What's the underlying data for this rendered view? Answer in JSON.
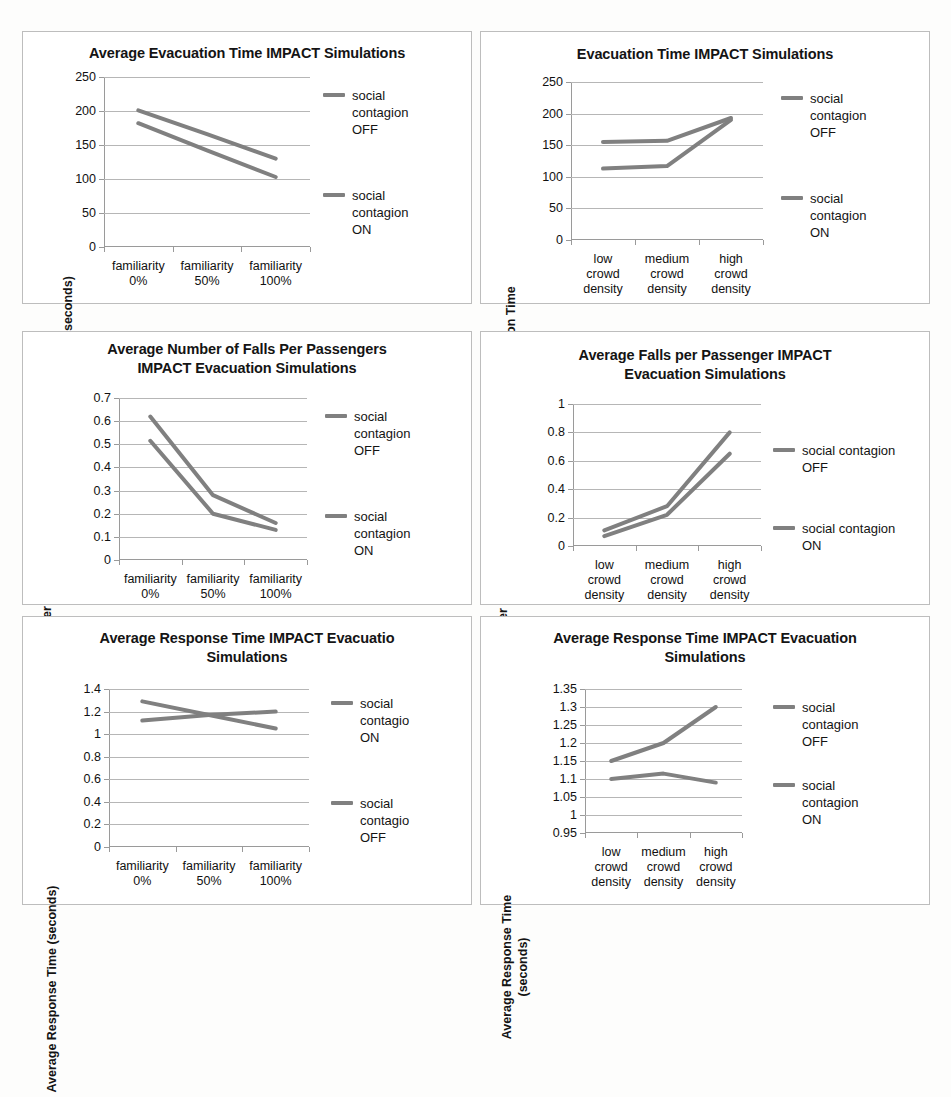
{
  "figure": {
    "panel_count": 6,
    "line_color": "#808080",
    "grid_color": "#b6b6b6",
    "axis_color": "#9a9a9a"
  },
  "chart_data": [
    {
      "id": "chart1",
      "type": "line",
      "title": "Average Evacuation Time IMPACT Simulations",
      "ylabel": "Evacuation Time (seconds)",
      "xlabel": "",
      "categories": [
        "familiarity\n0%",
        "familiarity\n50%",
        "familiarity\n100%"
      ],
      "yticks": [
        0,
        50,
        100,
        150,
        200,
        250
      ],
      "ylim": [
        0,
        250
      ],
      "grid": true,
      "legend_position": "right",
      "series": [
        {
          "name": "social\ncontagion\nOFF",
          "values": [
            201,
            166,
            130
          ]
        },
        {
          "name": "social\ncontagion\nON",
          "values": [
            182,
            142,
            103
          ]
        }
      ]
    },
    {
      "id": "chart2",
      "type": "line",
      "title": "Evacuation Time IMPACT Simulations",
      "ylabel": "Average Evacuation Time\n(seconds)",
      "xlabel": "",
      "categories": [
        "low\ncrowd\ndensity",
        "medium\ncrowd\ndensity",
        "high\ncrowd\ndensity"
      ],
      "yticks": [
        0,
        50,
        100,
        150,
        200,
        250
      ],
      "ylim": [
        0,
        250
      ],
      "grid": true,
      "legend_position": "right",
      "series": [
        {
          "name": "social\ncontagion\nOFF",
          "values": [
            155,
            157,
            193
          ]
        },
        {
          "name": "social\ncontagion\nON",
          "values": [
            113,
            117,
            190
          ]
        }
      ]
    },
    {
      "id": "chart3",
      "type": "line",
      "title": "Average Number of Falls Per Passengers\nIMPACT Evacuation Simulations",
      "ylabel": "Average Number of Falls per\nPassenger",
      "xlabel": "",
      "categories": [
        "familiarity\n0%",
        "familiarity\n50%",
        "familiarity\n100%"
      ],
      "yticks": [
        0,
        0.1,
        0.2,
        0.3,
        0.4,
        0.5,
        0.6,
        0.7
      ],
      "ytick_labels": [
        "0",
        "0.1",
        "0.2",
        "0.3",
        "0.4",
        "0.5",
        "0.6",
        "0.7"
      ],
      "ylim": [
        0,
        0.7
      ],
      "grid": true,
      "legend_position": "right",
      "series": [
        {
          "name": "social\ncontagion\nOFF",
          "values": [
            0.62,
            0.28,
            0.16
          ]
        },
        {
          "name": "social\ncontagion\nON",
          "values": [
            0.515,
            0.2,
            0.13
          ]
        }
      ]
    },
    {
      "id": "chart4",
      "type": "line",
      "title": "Average Falls per Passenger IMPACT\nEvacuation Simulations",
      "ylabel": "Average Number of Falls per\nPassenger",
      "xlabel": "",
      "categories": [
        "low\ncrowd\ndensity",
        "medium\ncrowd\ndensity",
        "high\ncrowd\ndensity"
      ],
      "yticks": [
        0,
        0.2,
        0.4,
        0.6,
        0.8,
        1
      ],
      "ytick_labels": [
        "0",
        "0.2",
        "0.4",
        "0.6",
        "0.8",
        "1"
      ],
      "ylim": [
        0,
        1
      ],
      "grid": true,
      "legend_position": "right",
      "series": [
        {
          "name": "social contagion\nOFF",
          "values": [
            0.11,
            0.28,
            0.8
          ]
        },
        {
          "name": "social contagion\nON",
          "values": [
            0.07,
            0.22,
            0.65
          ]
        }
      ]
    },
    {
      "id": "chart5",
      "type": "line",
      "title": "Average Response Time IMPACT Evacuatio\nSimulations",
      "ylabel": "Average Response Time (seconds)",
      "xlabel": "",
      "categories": [
        "familiarity\n0%",
        "familiarity\n50%",
        "familiarity\n100%"
      ],
      "yticks": [
        0,
        0.2,
        0.4,
        0.6,
        0.8,
        1,
        1.2,
        1.4
      ],
      "ytick_labels": [
        "0",
        "0.2",
        "0.4",
        "0.6",
        "0.8",
        "1",
        "1.2",
        "1.4"
      ],
      "ylim": [
        0,
        1.4
      ],
      "grid": true,
      "legend_position": "right",
      "series": [
        {
          "name": "social\ncontagio\nON",
          "values": [
            1.29,
            1.17,
            1.05
          ]
        },
        {
          "name": "social\ncontagio\nOFF",
          "values": [
            1.12,
            1.17,
            1.2
          ]
        }
      ]
    },
    {
      "id": "chart6",
      "type": "line",
      "title": "Average Response Time IMPACT Evacuation\nSimulations",
      "ylabel": "Average Response Time\n(seconds)",
      "xlabel": "",
      "categories": [
        "low\ncrowd\ndensity",
        "medium\ncrowd\ndensity",
        "high\ncrowd\ndensity"
      ],
      "yticks": [
        0.95,
        1,
        1.05,
        1.1,
        1.15,
        1.2,
        1.25,
        1.3,
        1.35
      ],
      "ytick_labels": [
        "0.95",
        "1",
        "1.05",
        "1.1",
        "1.15",
        "1.2",
        "1.25",
        "1.3",
        "1.35"
      ],
      "ylim": [
        0.95,
        1.35
      ],
      "grid": true,
      "legend_position": "right",
      "series": [
        {
          "name": "social\ncontagion\nOFF",
          "values": [
            1.15,
            1.2,
            1.3
          ]
        },
        {
          "name": "social\ncontagion\nON",
          "values": [
            1.1,
            1.115,
            1.09
          ]
        }
      ]
    }
  ]
}
